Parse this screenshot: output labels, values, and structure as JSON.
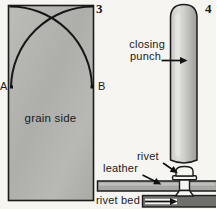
{
  "figure3": {
    "number": "3",
    "point_a_label": "A",
    "point_b_label": "B",
    "surface_label": "grain side"
  },
  "figure4": {
    "number": "4",
    "closing_punch_label_line1": "closing",
    "closing_punch_label_line2": "punch",
    "rivet_label": "rivet",
    "leather_label": "leather",
    "rivet_bed_label": "rivet bed"
  },
  "colors": {
    "background": "#f6f5f1",
    "strap_fill": "#b4b4b1",
    "punch_fill": "#cfcfcc",
    "leather_fill": "#a7a7a4",
    "rivet_bed_fill": "#6f6f6c",
    "rivet_fill": "#f5f5f1",
    "outline": "#1c1c1c"
  }
}
